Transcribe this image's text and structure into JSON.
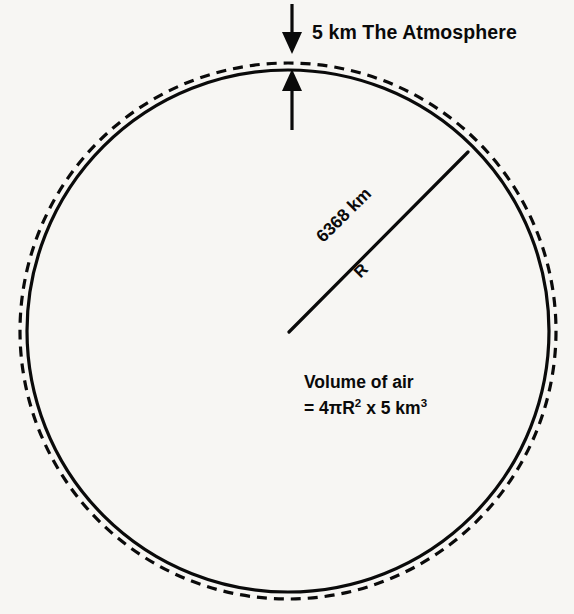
{
  "figure": {
    "title": "The Atmosphere",
    "background_color": "#f7f6f3",
    "ink_color": "#0a0a0a"
  },
  "labels": {
    "atmosphere": "5 km The Atmosphere",
    "atmosphere_thickness": "5 km",
    "atmosphere_name": "The Atmosphere",
    "radius_distance": "6368 km",
    "radius_symbol": "R",
    "volume_line1": "Volume of air",
    "volume_line2_prefix": "= 4πR",
    "volume_line2_exp1": "2",
    "volume_line2_middle": " x 5 km",
    "volume_line2_exp2": "3",
    "volume_line2_plain": "= 4πR2 x 5 km3"
  },
  "geometry": {
    "earth_circle": {
      "center_x": 288,
      "center_y": 331,
      "radius": 261,
      "style": "solid"
    },
    "atmosphere_circle": {
      "center_x": 288,
      "center_y": 331,
      "radius": 268,
      "style": "dashed"
    },
    "radius_line": {
      "from_x": 289,
      "from_y": 332,
      "to_x": 468,
      "to_y": 152
    },
    "arrow_down": {
      "x": 292,
      "from_y": 4,
      "to_y": 52
    },
    "arrow_up": {
      "x": 292,
      "from_y": 130,
      "to_y": 70
    }
  },
  "icons": {
    "down_arrow": "arrow-down-icon",
    "up_arrow": "arrow-up-icon"
  }
}
